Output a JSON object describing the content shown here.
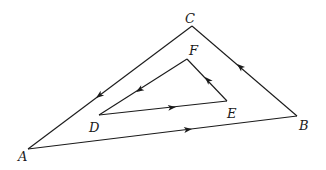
{
  "diagram": {
    "outer_triangle": {
      "vertices": {
        "A": {
          "label": "A",
          "x": 28,
          "y": 149
        },
        "B": {
          "label": "B",
          "x": 297,
          "y": 116
        },
        "C": {
          "label": "C",
          "x": 192,
          "y": 26
        }
      },
      "edges": [
        {
          "from": "A",
          "to": "B",
          "arrow": "toward B"
        },
        {
          "from": "B",
          "to": "C",
          "arrow": "toward C"
        },
        {
          "from": "C",
          "to": "A",
          "arrow": "toward A"
        }
      ]
    },
    "inner_triangle": {
      "vertices": {
        "D": {
          "label": "D",
          "x": 99,
          "y": 115
        },
        "E": {
          "label": "E",
          "x": 227,
          "y": 101
        },
        "F": {
          "label": "F",
          "x": 187,
          "y": 59
        }
      },
      "edges": [
        {
          "from": "D",
          "to": "E",
          "arrow": "toward E"
        },
        {
          "from": "E",
          "to": "F",
          "arrow": "toward F"
        },
        {
          "from": "F",
          "to": "D",
          "arrow": "toward D"
        }
      ]
    },
    "labels": {
      "A": "A",
      "B": "B",
      "C": "C",
      "D": "D",
      "E": "E",
      "F": "F"
    },
    "colors": {
      "stroke": "#1a1a1a",
      "background": "#ffffff"
    }
  }
}
